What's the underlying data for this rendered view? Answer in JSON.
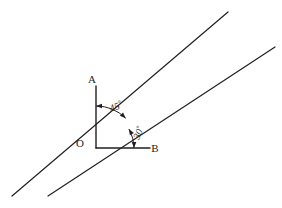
{
  "figure": {
    "background_color": "#ffffff",
    "stroke_color": "#231f20",
    "width": 282,
    "height": 208
  },
  "points": {
    "origin": {
      "label": "O",
      "x": 96,
      "y": 148,
      "label_x": 80,
      "label_y": 147
    },
    "a": {
      "label": "A",
      "x": 96,
      "y": 86,
      "label_x": 92,
      "label_y": 83
    },
    "b": {
      "label": "B",
      "x": 150,
      "y": 148,
      "label_x": 155,
      "label_y": 152
    }
  },
  "rays": {
    "oa": {
      "name": "ray-OA",
      "x1": 96,
      "y1": 148,
      "x2": 96,
      "y2": 86,
      "stroke_width": 1.4
    },
    "ob": {
      "name": "ray-OB",
      "x1": 96,
      "y1": 148,
      "x2": 150,
      "y2": 148,
      "stroke_width": 1.4
    }
  },
  "lines": [
    {
      "name": "line-45-from-vertical",
      "x1": 12,
      "y1": 196,
      "x2": 228,
      "y2": 12,
      "stroke_width": 1.2,
      "angle_from_horizontal_deg": 45
    },
    {
      "name": "line-30-from-horizontal",
      "x1": 48,
      "y1": 196,
      "x2": 275,
      "y2": 47,
      "stroke_width": 1.2,
      "angle_from_horizontal_deg": 30
    }
  ],
  "angles": [
    {
      "name": "angle-45",
      "value": "45",
      "degree_symbol": "°",
      "label_x": 111,
      "label_y": 112,
      "label_rotation_deg": -22,
      "arc_radius": 42,
      "from_deg": 90,
      "to_deg": 45,
      "between": [
        "ray-OA",
        "line-45-from-vertical"
      ]
    },
    {
      "name": "angle-30",
      "value": "30",
      "degree_symbol": "°",
      "label_x": 139,
      "label_y": 140,
      "label_rotation_deg": -66,
      "arc_radius": 38,
      "from_deg": 0,
      "to_deg": 30,
      "between": [
        "ray-OB",
        "line-30-from-horizontal"
      ]
    }
  ]
}
